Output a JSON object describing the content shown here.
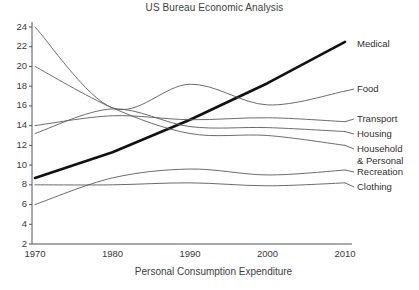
{
  "chart_data": {
    "type": "line",
    "title": "US Bureau Economic Analysis",
    "xlabel": "Personal Consumption Expenditure",
    "ylabel": "",
    "x": [
      1970,
      1980,
      1990,
      2000,
      2010
    ],
    "xtick_labels": [
      "1970",
      "1980",
      "1990",
      "2000",
      "2010"
    ],
    "ytick_labels": [
      "2",
      "4",
      "6",
      "8",
      "10",
      "12",
      "14",
      "16",
      "18",
      "20",
      "22",
      "24"
    ],
    "ytick_values": [
      2,
      4,
      6,
      8,
      10,
      12,
      14,
      16,
      18,
      20,
      22,
      24
    ],
    "xlim": [
      1968,
      2012
    ],
    "ylim": [
      2,
      24
    ],
    "grid": false,
    "legend_position": "right-inline-labels",
    "series": [
      {
        "name": "Medical",
        "emphasis": "thick",
        "color": "#111111",
        "values": [
          8.7,
          11.3,
          14.6,
          18.3,
          22.5
        ]
      },
      {
        "name": "Food",
        "emphasis": "normal",
        "color": "#5a5a5a",
        "values": [
          24.0,
          15.8,
          18.2,
          16.1,
          17.5
        ]
      },
      {
        "name": "Transport",
        "emphasis": "normal",
        "color": "#5a5a5a",
        "values": [
          14.0,
          15.0,
          14.6,
          14.8,
          14.4
        ]
      },
      {
        "name": "Housing",
        "emphasis": "normal",
        "color": "#5a5a5a",
        "values": [
          13.2,
          15.7,
          13.9,
          13.8,
          13.4
        ]
      },
      {
        "name": "Household & Personal",
        "emphasis": "normal",
        "color": "#5a5a5a",
        "values": [
          20.0,
          15.8,
          13.2,
          13.0,
          12.0
        ]
      },
      {
        "name": "Recreation",
        "emphasis": "normal",
        "color": "#5a5a5a",
        "values": [
          6.0,
          8.7,
          9.6,
          9.0,
          9.5
        ]
      },
      {
        "name": "Clothing",
        "emphasis": "normal",
        "color": "#5a5a5a",
        "values": [
          8.0,
          8.0,
          8.2,
          7.9,
          8.2
        ]
      }
    ],
    "series_labels": [
      {
        "text": "Medical",
        "line1": "Medical",
        "line2": ""
      },
      {
        "text": "Food",
        "line1": "Food",
        "line2": ""
      },
      {
        "text": "Transport",
        "line1": "Transport",
        "line2": ""
      },
      {
        "text": "Housing",
        "line1": "Housing",
        "line2": ""
      },
      {
        "text": "Household & Personal",
        "line1": "Household",
        "line2": "& Personal"
      },
      {
        "text": "Recreation",
        "line1": "Recreation",
        "line2": ""
      },
      {
        "text": "Clothing",
        "line1": "Clothing",
        "line2": ""
      }
    ]
  },
  "axis_color": "#555555",
  "text_color": "#3a3a3a"
}
